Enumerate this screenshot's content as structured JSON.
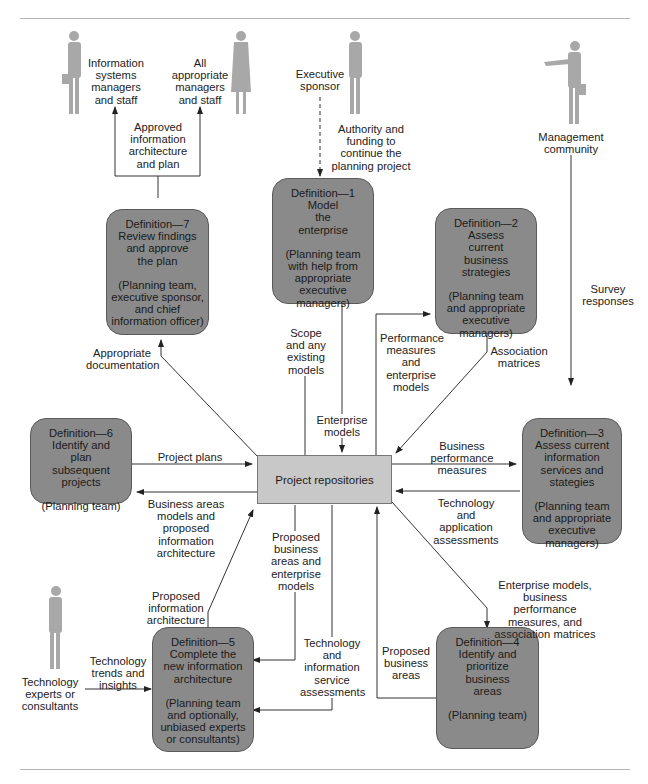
{
  "actors": {
    "is_staff": "Information\nsystems\nmanagers\nand staff",
    "all_managers": "All\nappropriate\nmanagers\nand staff",
    "executive_sponsor": "Executive\nsponsor",
    "management_community": "Management\ncommunity",
    "tech_experts": "Technology\nexperts or\nconsultants"
  },
  "repository": {
    "label": "Project repositories"
  },
  "steps": [
    {
      "id": 1,
      "title": "Definition—1\nModel\nthe\nenterprise",
      "who": "(Planning team\nwith help from\nappropriate\nexecutive managers)"
    },
    {
      "id": 2,
      "title": "Definition—2\nAssess\ncurrent\nbusiness\nstrategies",
      "who": "(Planning team\nand appropriate\nexecutive managers)"
    },
    {
      "id": 3,
      "title": "Definition—3\nAssess current\ninformation\nservices and\nstategies",
      "who": "(Planning team\nand appropriate\nexecutive managers)"
    },
    {
      "id": 4,
      "title": "Definition—4\nIdentify and\nprioritize\nbusiness\nareas",
      "who": "(Planning team)"
    },
    {
      "id": 5,
      "title": "Definition—5\nComplete the\nnew information\narchitecture",
      "who": "(Planning team\nand optionally,\nunbiased experts\nor consultants)"
    },
    {
      "id": 6,
      "title": "Definition—6\nIdentify and\nplan\nsubsequent\nprojects",
      "who": "(Planning team)"
    },
    {
      "id": 7,
      "title": "Definition—7\nReview findings\nand approve\nthe plan",
      "who": "(Planning team,\nexecutive sponsor,\nand chief\ninformation officer)"
    }
  ],
  "flows": {
    "approved_plan": "Approved\ninformation\narchitecture\nand plan",
    "authority_funding": "Authority and\nfunding to\ncontinue the\nplanning project",
    "survey_responses": "Survey\nresponses",
    "appropriate_documentation": "Appropriate\ndocumentation",
    "scope_models": "Scope\nand any\nexisting\nmodels",
    "enterprise_models": "Enterprise\nmodels",
    "perf_measures_models": "Performance\nmeasures\nand\nenterprise\nmodels",
    "association_matrices": "Association\nmatrices",
    "project_plans": "Project plans",
    "business_areas_models": "Business areas\nmodels and proposed\ninformation\narchitecture",
    "business_perf_measures": "Business performance\nmeasures",
    "tech_app_assessments": "Technology and\napplication\nassessments",
    "proposed_bus_areas_models": "Proposed\nbusiness\nareas and\nenterprise\nmodels",
    "enterprise_models_bpm_am": "Enterprise models,\nbusiness performance\nmeasures, and\nassociation matrices",
    "proposed_info_arch": "Proposed\ninformation\narchitecture",
    "tech_trends": "Technology\ntrends and\ninsights",
    "tech_info_service_assess": "Technology\nand\ninformation\nservice\nassessments",
    "proposed_business_areas": "Proposed\nbusiness\nareas"
  },
  "colors": {
    "step_box": "#8a8a8a",
    "repository_box": "#c8c8c8",
    "person_silhouette": "#a8a8a8",
    "line": "#333333"
  }
}
